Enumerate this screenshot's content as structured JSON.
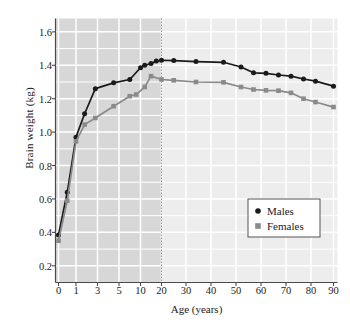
{
  "chart_data": {
    "type": "line",
    "title": "",
    "xlabel": "Age (years)",
    "ylabel": "Brain weight (kg)",
    "xticks": [
      0,
      1,
      3,
      5,
      10,
      20,
      30,
      40,
      50,
      60,
      70,
      80,
      90
    ],
    "xtick_labels": [
      "0",
      "1",
      "3",
      "5",
      "10",
      "20",
      "30",
      "40",
      "50",
      "60",
      "70",
      "80",
      "90"
    ],
    "yticks": [
      0.2,
      0.4,
      0.6,
      0.8,
      1.0,
      1.2,
      1.4,
      1.6
    ],
    "ytick_labels": [
      "0.2",
      "0.4",
      "0.6",
      "0.8",
      "1.0",
      "1.2",
      "1.4",
      "1.6"
    ],
    "ylim": [
      0.1,
      1.68
    ],
    "xscale": "piecewise-compressed",
    "grid": true,
    "grid_color": "#ffffff",
    "legend_position": "lower right",
    "shaded_region": {
      "from_age": 0,
      "to_age": 20,
      "color": "#d7d7d7",
      "note": "growth phase shaded darker"
    },
    "background_right": {
      "from_age": 20,
      "to_age": 90,
      "color": "#ededed"
    },
    "divider_line": {
      "at_age": 20,
      "style": "dotted",
      "color": "#9a9a9a"
    },
    "series": [
      {
        "name": "Males",
        "color": "#1a1a1a",
        "marker": "circle",
        "points": [
          {
            "x": 0,
            "y": 0.385
          },
          {
            "x": 0.5,
            "y": 0.64
          },
          {
            "x": 1,
            "y": 0.97
          },
          {
            "x": 1.8,
            "y": 1.11
          },
          {
            "x": 2.8,
            "y": 1.26
          },
          {
            "x": 4.5,
            "y": 1.295
          },
          {
            "x": 7.5,
            "y": 1.315
          },
          {
            "x": 10,
            "y": 1.385
          },
          {
            "x": 12,
            "y": 1.4
          },
          {
            "x": 15,
            "y": 1.41
          },
          {
            "x": 17.5,
            "y": 1.425
          },
          {
            "x": 20,
            "y": 1.43
          },
          {
            "x": 25,
            "y": 1.428
          },
          {
            "x": 34,
            "y": 1.422
          },
          {
            "x": 45,
            "y": 1.418
          },
          {
            "x": 52,
            "y": 1.39
          },
          {
            "x": 57,
            "y": 1.355
          },
          {
            "x": 62,
            "y": 1.352
          },
          {
            "x": 67,
            "y": 1.342
          },
          {
            "x": 72,
            "y": 1.335
          },
          {
            "x": 77,
            "y": 1.318
          },
          {
            "x": 82,
            "y": 1.305
          },
          {
            "x": 90,
            "y": 1.275
          }
        ]
      },
      {
        "name": "Females",
        "color": "#8a8a8a",
        "marker": "square",
        "points": [
          {
            "x": 0,
            "y": 0.35
          },
          {
            "x": 0.5,
            "y": 0.59
          },
          {
            "x": 1,
            "y": 0.945
          },
          {
            "x": 1.8,
            "y": 1.045
          },
          {
            "x": 2.8,
            "y": 1.085
          },
          {
            "x": 4.5,
            "y": 1.155
          },
          {
            "x": 7.5,
            "y": 1.215
          },
          {
            "x": 9,
            "y": 1.225
          },
          {
            "x": 12,
            "y": 1.27
          },
          {
            "x": 15,
            "y": 1.335
          },
          {
            "x": 20,
            "y": 1.315
          },
          {
            "x": 25,
            "y": 1.31
          },
          {
            "x": 34,
            "y": 1.3
          },
          {
            "x": 45,
            "y": 1.298
          },
          {
            "x": 52,
            "y": 1.27
          },
          {
            "x": 57,
            "y": 1.255
          },
          {
            "x": 62,
            "y": 1.25
          },
          {
            "x": 67,
            "y": 1.248
          },
          {
            "x": 72,
            "y": 1.235
          },
          {
            "x": 77,
            "y": 1.2
          },
          {
            "x": 82,
            "y": 1.18
          },
          {
            "x": 90,
            "y": 1.15
          }
        ]
      }
    ]
  },
  "legend": {
    "items": [
      {
        "label": "Males",
        "marker": "circle",
        "color": "#1a1a1a"
      },
      {
        "label": "Females",
        "marker": "square",
        "color": "#8a8a8a"
      }
    ]
  },
  "axis": {
    "x_title": "Age (years)",
    "y_title": "Brain weight (kg)"
  }
}
